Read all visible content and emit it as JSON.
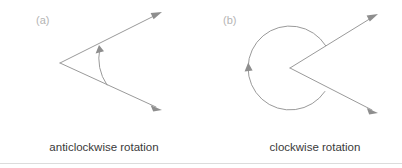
{
  "figure": {
    "width": 402,
    "height": 168,
    "background_color": "#ffffff",
    "line_color": "#9a9a9a",
    "arrow_fill_color": "#8e8e8e",
    "caption_color": "#3a3a3a",
    "panel_label_color": "#b4b4b4",
    "rule_color": "#dcdcdc"
  },
  "panels": [
    {
      "id": "a",
      "label": "(a)",
      "caption": "anticlockwise rotation",
      "rotation_direction": "anticlockwise",
      "angle_type": "acute",
      "vertex": {
        "x": 60,
        "y": 63
      },
      "rays": [
        {
          "name": "upper-ray",
          "from": {
            "x": 60,
            "y": 63
          },
          "to": {
            "x": 162,
            "y": 12
          }
        },
        {
          "name": "lower-ray",
          "from": {
            "x": 60,
            "y": 63
          },
          "to": {
            "x": 162,
            "y": 110
          }
        }
      ],
      "arc": {
        "radius": 48,
        "start": {
          "x": 107,
          "y": 85
        },
        "end": {
          "x": 99,
          "y": 47
        },
        "sweep": "anticlockwise",
        "arrow_at": "end",
        "arrow_point": {
          "x": 99,
          "y": 45
        }
      },
      "label_pos": {
        "x": 36,
        "y": 24
      },
      "caption_pos": {
        "x": 104,
        "y": 151
      }
    },
    {
      "id": "b",
      "label": "(b)",
      "caption": "clockwise rotation",
      "rotation_direction": "clockwise",
      "angle_type": "reflex",
      "vertex": {
        "x": 290,
        "y": 68
      },
      "rays": [
        {
          "name": "upper-ray",
          "from": {
            "x": 290,
            "y": 68
          },
          "to": {
            "x": 378,
            "y": 14
          }
        },
        {
          "name": "lower-ray",
          "from": {
            "x": 290,
            "y": 68
          },
          "to": {
            "x": 378,
            "y": 113
          }
        }
      ],
      "arc": {
        "radius": 42,
        "start": {
          "x": 325,
          "y": 45
        },
        "end": {
          "x": 324,
          "y": 92
        },
        "sweep": "clockwise-reflex",
        "arrow_at": "end",
        "arrow_point": {
          "x": 248,
          "y": 66
        }
      },
      "label_pos": {
        "x": 223,
        "y": 24
      },
      "caption_pos": {
        "x": 315,
        "y": 151
      }
    }
  ],
  "bottom_rule": {
    "y": 163
  }
}
